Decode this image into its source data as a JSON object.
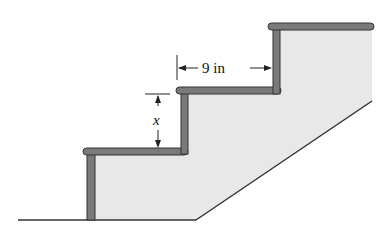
{
  "diagram": {
    "type": "staircase-cross-section",
    "labels": {
      "tread_depth": "9 in",
      "riser_height": "x"
    },
    "colors": {
      "stair_fill": "#e8e8e8",
      "tread_fill": "#7a7a7a",
      "outline": "#333333",
      "background": "#ffffff"
    }
  }
}
